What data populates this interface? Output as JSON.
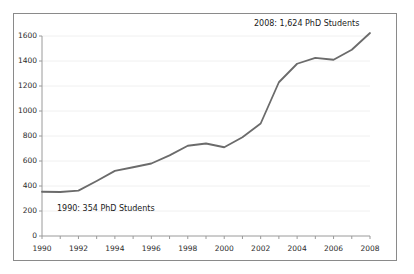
{
  "figure": {
    "background_color": "#ffffff",
    "border_color": "#8a8a8a",
    "line_color": "#6b6b6b",
    "grid_color": "#f0f0f0",
    "axis_color": "#9a9a9a",
    "text_color": "#1a1a1a"
  },
  "annotations": {
    "end_label": "2008: 1,624 PhD Students",
    "start_label": "1990: 354 PhD Students"
  },
  "chart_data": {
    "type": "line",
    "title": "",
    "subtitle": "",
    "xlabel": "",
    "ylabel": "",
    "xlim": [
      1990,
      2008
    ],
    "ylim": [
      0,
      1600
    ],
    "grid": true,
    "legend": false,
    "legend_position": "none",
    "y_ticks": [
      0,
      200,
      400,
      600,
      800,
      1000,
      1200,
      1400,
      1600
    ],
    "y_tick_labels": [
      "0",
      "200",
      "400",
      "600",
      "800",
      "1000",
      "1200",
      "1400",
      "1600"
    ],
    "x_ticks": [
      1990,
      1991,
      1992,
      1993,
      1994,
      1995,
      1996,
      1997,
      1998,
      1999,
      2000,
      2001,
      2002,
      2003,
      2004,
      2005,
      2006,
      2007,
      2008
    ],
    "x_tick_labels_major": [
      "1990",
      "1992",
      "1994",
      "1996",
      "1998",
      "2000",
      "2002",
      "2004",
      "2006",
      "2008"
    ],
    "x": [
      1990,
      1991,
      1992,
      1993,
      1994,
      1995,
      1996,
      1997,
      1998,
      1999,
      2000,
      2001,
      2002,
      2003,
      2004,
      2005,
      2006,
      2007,
      2008
    ],
    "values": [
      354,
      352,
      363,
      440,
      521,
      550,
      580,
      645,
      722,
      740,
      710,
      790,
      900,
      1230,
      1378,
      1425,
      1410,
      1490,
      1624
    ],
    "series": [
      {
        "name": "PhD Students",
        "values": [
          354,
          352,
          363,
          440,
          521,
          550,
          580,
          645,
          722,
          740,
          710,
          790,
          900,
          1230,
          1378,
          1425,
          1410,
          1490,
          1624
        ]
      }
    ]
  }
}
